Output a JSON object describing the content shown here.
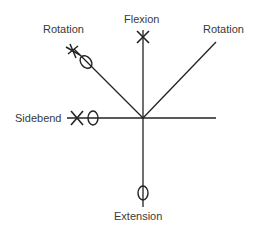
{
  "diagram": {
    "labels": {
      "flexion": "Flexion",
      "rotation_left": "Rotation",
      "rotation_right": "Rotation",
      "sidebend": "Sidebend",
      "extension": "Extension"
    },
    "stroke_color": "#222222",
    "text_color": "#3a3a3a",
    "markers": {
      "flexion": [
        "x"
      ],
      "rotation_left": [
        "star",
        "o"
      ],
      "sidebend": [
        "x",
        "o"
      ],
      "extension": [
        "o"
      ]
    }
  }
}
